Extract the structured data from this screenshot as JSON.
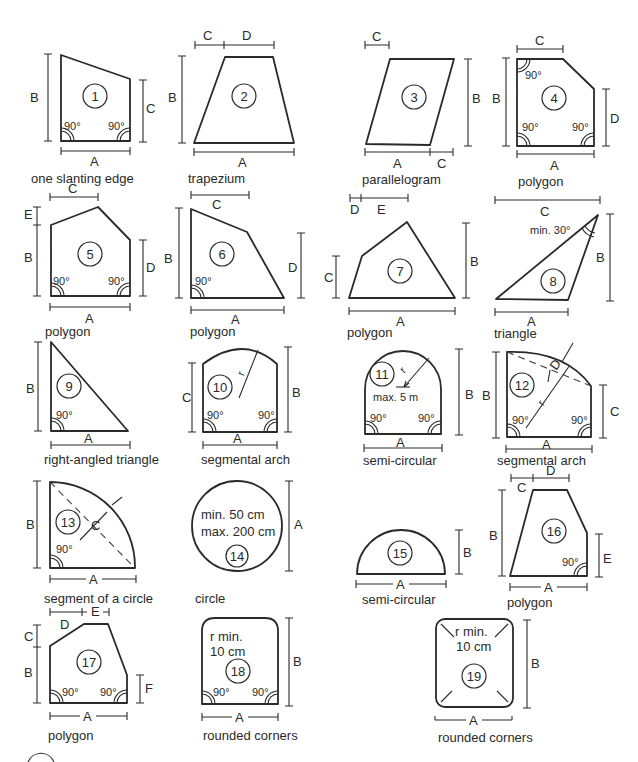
{
  "diagram": {
    "shapes": [
      {
        "id": "1",
        "caption": "one slanting edge",
        "dims": [
          "A",
          "B",
          "C"
        ],
        "angles": [
          "90°",
          "90°"
        ]
      },
      {
        "id": "2",
        "caption": "trapezium",
        "dims": [
          "A",
          "B",
          "C",
          "D"
        ]
      },
      {
        "id": "3",
        "caption": "parallelogram",
        "dims": [
          "A",
          "B",
          "C",
          "C"
        ]
      },
      {
        "id": "4",
        "caption": "polygon",
        "dims": [
          "A",
          "B",
          "C",
          "D"
        ],
        "angles": [
          "90°",
          "90°",
          "90°"
        ]
      },
      {
        "id": "5",
        "caption": "polygon",
        "dims": [
          "A",
          "B",
          "C",
          "D",
          "E"
        ],
        "angles": [
          "90°",
          "90°"
        ]
      },
      {
        "id": "6",
        "caption": "polygon",
        "dims": [
          "A",
          "B",
          "C",
          "D"
        ],
        "angles": [
          "90°"
        ]
      },
      {
        "id": "7",
        "caption": "polygon",
        "dims": [
          "A",
          "B",
          "C",
          "D",
          "E"
        ]
      },
      {
        "id": "8",
        "caption": "triangle",
        "dims": [
          "A",
          "B",
          "C"
        ],
        "note": "min. 30°"
      },
      {
        "id": "9",
        "caption": "right-angled triangle",
        "dims": [
          "A",
          "B"
        ],
        "angles": [
          "90°"
        ]
      },
      {
        "id": "10",
        "caption": "segmental arch",
        "dims": [
          "A",
          "B",
          "C",
          "r"
        ],
        "angles": [
          "90°",
          "90°"
        ]
      },
      {
        "id": "11",
        "caption": "semi-circular",
        "dims": [
          "A",
          "B",
          "r"
        ],
        "note": "max. 5 m",
        "angles": [
          "90°",
          "90°"
        ]
      },
      {
        "id": "12",
        "caption": "segmental arch",
        "dims": [
          "A",
          "B",
          "C",
          "D",
          "r"
        ],
        "angles": [
          "90°",
          "90°"
        ]
      },
      {
        "id": "13",
        "caption": "segment of a circle",
        "dims": [
          "A",
          "B",
          "C"
        ],
        "angles": [
          "90°"
        ]
      },
      {
        "id": "14",
        "caption": "circle",
        "dims": [
          "A"
        ],
        "note_lines": [
          "min. 50 cm",
          "max. 200 cm"
        ]
      },
      {
        "id": "15",
        "caption": "semi-circular",
        "dims": [
          "A",
          "B"
        ]
      },
      {
        "id": "16",
        "caption": "polygon",
        "dims": [
          "A",
          "B",
          "C",
          "D",
          "E"
        ],
        "angles": [
          "90°"
        ]
      },
      {
        "id": "17",
        "caption": "polygon",
        "dims": [
          "A",
          "B",
          "C",
          "D",
          "E",
          "F"
        ],
        "angles": [
          "90°",
          "90°"
        ]
      },
      {
        "id": "18",
        "caption": "rounded corners",
        "dims": [
          "A",
          "B"
        ],
        "note_lines": [
          "r min.",
          "10 cm"
        ],
        "angles": [
          "90°",
          "90°"
        ]
      },
      {
        "id": "19",
        "caption": "rounded corners",
        "dims": [
          "A",
          "B"
        ],
        "note_lines": [
          "r min.",
          "10 cm"
        ]
      }
    ]
  }
}
